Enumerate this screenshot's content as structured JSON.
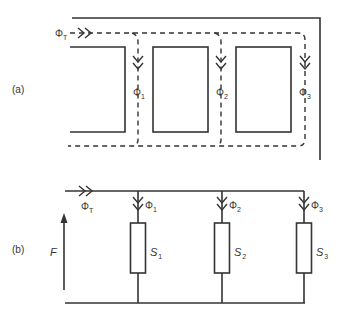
{
  "diagram": {
    "type": "magnetic circuit and equivalent reluctance network",
    "colors": {
      "stroke": "#333333",
      "background": "#ffffff"
    },
    "part_a": {
      "label": "(a)",
      "description": "Magnetic core with three parallel limbs; dashed flux paths",
      "total_flux": {
        "symbol": "Φ",
        "subscript": "T"
      },
      "branch_fluxes": [
        {
          "symbol": "Φ",
          "subscript": "1"
        },
        {
          "symbol": "Φ",
          "subscript": "2"
        },
        {
          "symbol": "Φ",
          "subscript": "3"
        }
      ]
    },
    "part_b": {
      "label": "(b)",
      "description": "Equivalent circuit: MMF source F driving three parallel reluctances",
      "mmf": "F",
      "total_flux": {
        "symbol": "Φ",
        "subscript": "T"
      },
      "branches": [
        {
          "flux_symbol": "Φ",
          "flux_subscript": "1",
          "reluctance_symbol": "S",
          "reluctance_subscript": "1"
        },
        {
          "flux_symbol": "Φ",
          "flux_subscript": "2",
          "reluctance_symbol": "S",
          "reluctance_subscript": "2"
        },
        {
          "flux_symbol": "Φ",
          "flux_subscript": "3",
          "reluctance_symbol": "S",
          "reluctance_subscript": "3"
        }
      ]
    }
  }
}
